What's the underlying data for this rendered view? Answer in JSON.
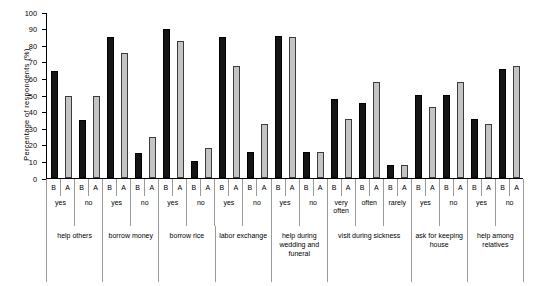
{
  "chart_data": {
    "type": "bar",
    "title": "",
    "xlabel": "",
    "ylabel": "Percentage of respondents (%)",
    "ylim": [
      0,
      100
    ],
    "ytick_step": 10,
    "yticks": [
      0,
      10,
      20,
      30,
      40,
      50,
      60,
      70,
      80,
      90,
      100
    ],
    "grid": false,
    "legend": [],
    "series_labels": [
      "B",
      "A"
    ],
    "colors": {
      "B": "#141414",
      "A": "#c4c4c4",
      "axis": "#000000",
      "separator": "#9a9a9a"
    },
    "categories": [
      "help others / yes",
      "help others / no",
      "borrow money / yes",
      "borrow money / no",
      "borrow rice / yes",
      "borrow rice / no",
      "labor exchange / yes",
      "labor exchange / no",
      "help during wedding and funeral / yes",
      "help during wedding and funeral / no",
      "visit during sickness / very often",
      "visit during sickness / often",
      "visit during sickness / rarely",
      "ask for keeping house / yes",
      "ask for keeping house / no",
      "help among relatives / yes",
      "help among relatives / no"
    ],
    "series": [
      {
        "name": "B",
        "values": [
          65,
          35,
          85.5,
          15,
          90.5,
          10.5,
          85.5,
          15.5,
          86,
          15.5,
          48,
          45.5,
          8,
          50.5,
          50.5,
          35.5,
          66
        ]
      },
      {
        "name": "A",
        "values": [
          50,
          50,
          75.5,
          25,
          83,
          18,
          68,
          33,
          85.5,
          15.5,
          35.5,
          58,
          8,
          43,
          58,
          33,
          68
        ]
      }
    ],
    "bars": [
      {
        "group": "help others",
        "answer": "yes",
        "series": "B",
        "value": 65
      },
      {
        "group": "help others",
        "answer": "yes",
        "series": "A",
        "value": 50
      },
      {
        "group": "help others",
        "answer": "no",
        "series": "B",
        "value": 35
      },
      {
        "group": "help others",
        "answer": "no",
        "series": "A",
        "value": 50
      },
      {
        "group": "borrow money",
        "answer": "yes",
        "series": "B",
        "value": 85.5
      },
      {
        "group": "borrow money",
        "answer": "yes",
        "series": "A",
        "value": 75.5
      },
      {
        "group": "borrow money",
        "answer": "no",
        "series": "B",
        "value": 15
      },
      {
        "group": "borrow money",
        "answer": "no",
        "series": "A",
        "value": 25
      },
      {
        "group": "borrow rice",
        "answer": "yes",
        "series": "B",
        "value": 90.5
      },
      {
        "group": "borrow rice",
        "answer": "yes",
        "series": "A",
        "value": 83
      },
      {
        "group": "borrow rice",
        "answer": "no",
        "series": "B",
        "value": 10.5
      },
      {
        "group": "borrow rice",
        "answer": "no",
        "series": "A",
        "value": 18
      },
      {
        "group": "labor exchange",
        "answer": "yes",
        "series": "B",
        "value": 85.5
      },
      {
        "group": "labor exchange",
        "answer": "yes",
        "series": "A",
        "value": 68
      },
      {
        "group": "labor exchange",
        "answer": "no",
        "series": "B",
        "value": 15.5
      },
      {
        "group": "labor exchange",
        "answer": "no",
        "series": "A",
        "value": 33
      },
      {
        "group": "help during wedding and funeral",
        "answer": "yes",
        "series": "B",
        "value": 86
      },
      {
        "group": "help during wedding and funeral",
        "answer": "yes",
        "series": "A",
        "value": 85.5
      },
      {
        "group": "help during wedding and funeral",
        "answer": "no",
        "series": "B",
        "value": 15.5
      },
      {
        "group": "help during wedding and funeral",
        "answer": "no",
        "series": "A",
        "value": 15.5
      },
      {
        "group": "visit during sickness",
        "answer": "very often",
        "series": "B",
        "value": 48
      },
      {
        "group": "visit during sickness",
        "answer": "very often",
        "series": "A",
        "value": 35.5
      },
      {
        "group": "visit during sickness",
        "answer": "often",
        "series": "B",
        "value": 45.5
      },
      {
        "group": "visit during sickness",
        "answer": "often",
        "series": "A",
        "value": 58
      },
      {
        "group": "visit during sickness",
        "answer": "rarely",
        "series": "B",
        "value": 8
      },
      {
        "group": "visit during sickness",
        "answer": "rarely",
        "series": "A",
        "value": 8
      },
      {
        "group": "ask for keeping house",
        "answer": "yes",
        "series": "B",
        "value": 50.5
      },
      {
        "group": "ask for keeping house",
        "answer": "yes",
        "series": "A",
        "value": 43
      },
      {
        "group": "ask for keeping house",
        "answer": "no",
        "series": "B",
        "value": 50.5
      },
      {
        "group": "ask for keeping house",
        "answer": "no",
        "series": "A",
        "value": 58
      },
      {
        "group": "help among relatives",
        "answer": "yes",
        "series": "B",
        "value": 35.5
      },
      {
        "group": "help among relatives",
        "answer": "yes",
        "series": "A",
        "value": 33
      },
      {
        "group": "help among relatives",
        "answer": "no",
        "series": "B",
        "value": 66
      },
      {
        "group": "help among relatives",
        "answer": "no",
        "series": "A",
        "value": 68
      }
    ],
    "answer_cells": [
      {
        "label": "yes",
        "span": 2
      },
      {
        "label": "no",
        "span": 2
      },
      {
        "label": "yes",
        "span": 2
      },
      {
        "label": "no",
        "span": 2
      },
      {
        "label": "yes",
        "span": 2
      },
      {
        "label": "no",
        "span": 2
      },
      {
        "label": "yes",
        "span": 2
      },
      {
        "label": "no",
        "span": 2
      },
      {
        "label": "yes",
        "span": 2
      },
      {
        "label": "no",
        "span": 2
      },
      {
        "label": "very often",
        "span": 2
      },
      {
        "label": "often",
        "span": 2
      },
      {
        "label": "rarely",
        "span": 2
      },
      {
        "label": "yes",
        "span": 2
      },
      {
        "label": "no",
        "span": 2
      },
      {
        "label": "yes",
        "span": 2
      },
      {
        "label": "no",
        "span": 2
      }
    ],
    "group_cells": [
      {
        "label": "help others",
        "span": 4
      },
      {
        "label": "borrow money",
        "span": 4
      },
      {
        "label": "borrow rice",
        "span": 4
      },
      {
        "label": "labor exchange",
        "span": 4
      },
      {
        "label": "help during wedding and funeral",
        "span": 4
      },
      {
        "label": "visit during sickness",
        "span": 6
      },
      {
        "label": "ask for keeping house",
        "span": 4
      },
      {
        "label": "help among relatives",
        "span": 4
      }
    ]
  }
}
